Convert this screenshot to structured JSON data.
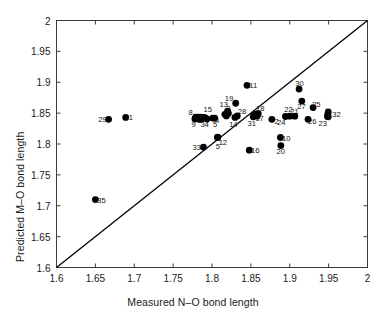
{
  "chart_data": {
    "type": "scatter",
    "title": "",
    "xlabel": "Measured N–O bond length",
    "ylabel": "Predicted M–O bond length",
    "xlim": [
      1.6,
      2.0
    ],
    "ylim": [
      1.6,
      2.0
    ],
    "xticks": [
      "1.6",
      "1.65",
      "1.7",
      "1.75",
      "1.8",
      "1.85",
      "1.9",
      "1.95",
      "2"
    ],
    "xtick_values": [
      1.6,
      1.65,
      1.7,
      1.75,
      1.8,
      1.85,
      1.9,
      1.95,
      2.0
    ],
    "yticks": [
      "1.6",
      "1.65",
      "1.7",
      "1.75",
      "1.8",
      "1.85",
      "1.9",
      "1.95",
      "2"
    ],
    "ytick_values": [
      1.6,
      1.65,
      1.7,
      1.75,
      1.8,
      1.85,
      1.9,
      1.95,
      2.0
    ],
    "grid": false,
    "legend": null,
    "marker_color": "#000000",
    "marker_size": 3.4,
    "reference_line": {
      "name": "identity-line",
      "from": [
        1.6,
        1.6
      ],
      "to": [
        2.0,
        2.0
      ],
      "color": "#000000",
      "width": 1.3
    },
    "points": [
      {
        "label": "1",
        "x": 1.689,
        "y": 1.843,
        "lx": 1.6955,
        "ly": 1.843
      },
      {
        "label": "2",
        "x": 1.877,
        "y": 1.84,
        "lx": 1.883,
        "ly": 1.837
      },
      {
        "label": "3",
        "x": 1.8205,
        "y": 1.851,
        "lx": 1.821,
        "ly": 1.8585
      },
      {
        "label": "4",
        "x": 1.801,
        "y": 1.842,
        "lx": 1.8065,
        "ly": 1.8395
      },
      {
        "label": "5",
        "x": 1.807,
        "y": 1.8105,
        "lx": 1.8075,
        "ly": 1.7965
      },
      {
        "label": "5",
        "x": 1.8035,
        "y": 1.842,
        "lx": 1.804,
        "ly": 1.833
      },
      {
        "label": "8",
        "x": 1.779,
        "y": 1.8435,
        "lx": 1.7725,
        "ly": 1.8525
      },
      {
        "label": "9",
        "x": 1.778,
        "y": 1.8405,
        "lx": 1.7765,
        "ly": 1.8325
      },
      {
        "label": "10",
        "x": 1.888,
        "y": 1.8105,
        "lx": 1.8955,
        "ly": 1.8105
      },
      {
        "label": "11",
        "x": 1.845,
        "y": 1.895,
        "lx": 1.853,
        "ly": 1.895
      },
      {
        "label": "12",
        "x": 1.8075,
        "y": 1.811,
        "lx": 1.814,
        "ly": 1.804
      },
      {
        "label": "13",
        "x": 1.8165,
        "y": 1.848,
        "lx": 1.815,
        "ly": 1.864
      },
      {
        "label": "14",
        "x": 1.8295,
        "y": 1.843,
        "lx": 1.8275,
        "ly": 1.833
      },
      {
        "label": "15",
        "x": 1.7905,
        "y": 1.8425,
        "lx": 1.7945,
        "ly": 1.857
      },
      {
        "label": "16",
        "x": 1.848,
        "y": 1.79,
        "lx": 1.8555,
        "ly": 1.79
      },
      {
        "label": "17",
        "x": 1.8555,
        "y": 1.847,
        "lx": 1.861,
        "ly": 1.842
      },
      {
        "label": "18",
        "x": 1.8595,
        "y": 1.849,
        "lx": 1.862,
        "ly": 1.858
      },
      {
        "label": "19",
        "x": 1.8305,
        "y": 1.866,
        "lx": 1.822,
        "ly": 1.874
      },
      {
        "label": "20",
        "x": 1.8885,
        "y": 1.7975,
        "lx": 1.8885,
        "ly": 1.7885
      },
      {
        "label": "21",
        "x": 1.9065,
        "y": 1.845,
        "lx": 1.906,
        "ly": 1.854
      },
      {
        "label": "22",
        "x": 1.9,
        "y": 1.845,
        "lx": 1.8985,
        "ly": 1.857
      },
      {
        "label": "23",
        "x": 1.9495,
        "y": 1.844,
        "lx": 1.9425,
        "ly": 1.8335
      },
      {
        "label": "24",
        "x": 1.8945,
        "y": 1.8445,
        "lx": 1.889,
        "ly": 1.8355
      },
      {
        "label": "25",
        "x": 1.93,
        "y": 1.859,
        "lx": 1.934,
        "ly": 1.865
      },
      {
        "label": "26",
        "x": 1.9235,
        "y": 1.84,
        "lx": 1.929,
        "ly": 1.8375
      },
      {
        "label": "27",
        "x": 1.9155,
        "y": 1.8695,
        "lx": 1.915,
        "ly": 1.8615
      },
      {
        "label": "28",
        "x": 1.8325,
        "y": 1.8455,
        "lx": 1.8385,
        "ly": 1.853
      },
      {
        "label": "29",
        "x": 1.667,
        "y": 1.84,
        "lx": 1.659,
        "ly": 1.84
      },
      {
        "label": "30",
        "x": 1.912,
        "y": 1.889,
        "lx": 1.9125,
        "ly": 1.8985
      },
      {
        "label": "31",
        "x": 1.853,
        "y": 1.844,
        "lx": 1.851,
        "ly": 1.8335
      },
      {
        "label": "32",
        "x": 1.949,
        "y": 1.8485,
        "lx": 1.96,
        "ly": 1.849
      },
      {
        "label": "33",
        "x": 1.789,
        "y": 1.795,
        "lx": 1.7805,
        "ly": 1.7955
      },
      {
        "label": "34",
        "x": 1.7935,
        "y": 1.8405,
        "lx": 1.7905,
        "ly": 1.833
      },
      {
        "label": "35",
        "x": 1.65,
        "y": 1.71,
        "lx": 1.658,
        "ly": 1.7095
      }
    ],
    "extra_cluster_points": [
      {
        "x": 1.782,
        "y": 1.8435
      },
      {
        "x": 1.785,
        "y": 1.8435
      },
      {
        "x": 1.7875,
        "y": 1.843
      },
      {
        "x": 1.7905,
        "y": 1.8425
      },
      {
        "x": 1.7835,
        "y": 1.84
      },
      {
        "x": 1.786,
        "y": 1.84
      },
      {
        "x": 1.8185,
        "y": 1.8455
      },
      {
        "x": 1.821,
        "y": 1.8495
      },
      {
        "x": 1.82,
        "y": 1.853
      },
      {
        "x": 1.854,
        "y": 1.8465
      },
      {
        "x": 1.8565,
        "y": 1.8485
      },
      {
        "x": 1.858,
        "y": 1.845
      },
      {
        "x": 1.9485,
        "y": 1.8445
      },
      {
        "x": 1.9495,
        "y": 1.852
      }
    ]
  }
}
